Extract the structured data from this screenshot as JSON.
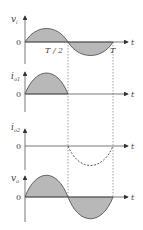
{
  "diagram": {
    "title": "",
    "colors": {
      "axis": "#555555",
      "fill": "#b8b8b8",
      "curve": "#444444",
      "guide": "#888888"
    },
    "time_axis_label": "t",
    "markers": {
      "half_period": "T / 2",
      "period": "T"
    },
    "panels": [
      {
        "id": "vi",
        "y_label": "v",
        "y_sub": "i",
        "zero": "0",
        "t_label": "t",
        "waveform": "full sine, shaded both halves"
      },
      {
        "id": "io1",
        "y_label": "i",
        "y_sub": "o1",
        "zero": "0",
        "t_label": "t",
        "waveform": "positive half-sine 0..T/2, shaded"
      },
      {
        "id": "io2",
        "y_label": "i",
        "y_sub": "o2",
        "zero": "0",
        "t_label": "t",
        "waveform": "negative half-sine T/2..T, dashed"
      },
      {
        "id": "vo",
        "y_label": "v",
        "y_sub": "o",
        "zero": "0",
        "t_label": "t",
        "waveform": "full sine, shaded both halves"
      }
    ]
  }
}
